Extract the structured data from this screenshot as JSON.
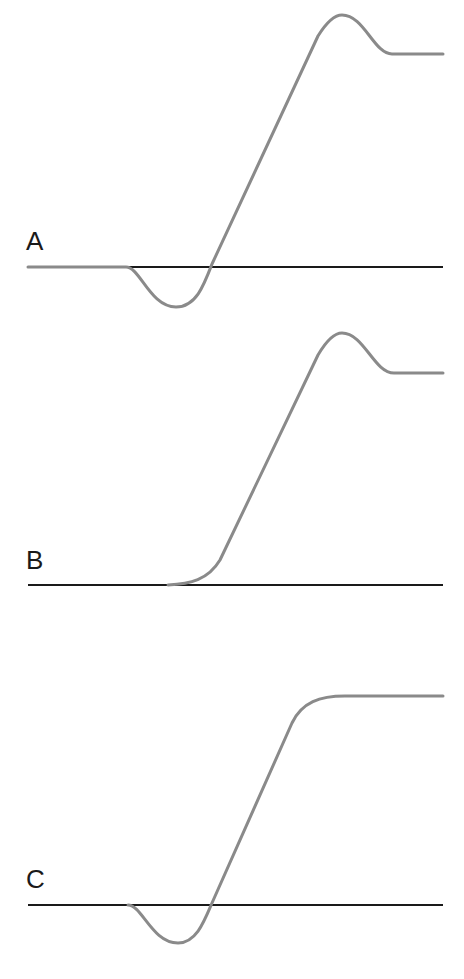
{
  "panels": [
    {
      "label": "A",
      "label_pos": [
        26,
        228
      ],
      "baseline_y": 267,
      "path": "M28,267 L126,267 C140,267 150,307 176,307 C196,307 204,285 212,264 L318,36 C328,20 336,15 342,15 C364,15 374,54 392,54 L443,54"
    },
    {
      "label": "B",
      "label_pos": [
        26,
        547
      ],
      "baseline_y": 585,
      "path": "M168,585 C190,584 208,580 220,560 L318,355 C328,338 336,333 342,333 C364,333 374,373 394,373 L443,373"
    },
    {
      "label": "C",
      "label_pos": [
        26,
        866
      ],
      "baseline_y": 905,
      "path": "M128,905 C142,905 152,943 178,943 C196,943 204,922 212,903 L292,723 C302,702 320,696 345,696 L443,696"
    }
  ],
  "colors": {
    "baseline": "#1a1a1a",
    "curve": "#8a8a8a",
    "text": "#1a1a1a"
  }
}
